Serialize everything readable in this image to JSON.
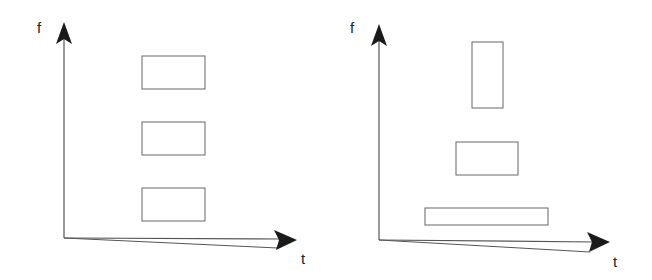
{
  "diagrams": [
    {
      "name": "stft-tiling",
      "y_axis_label": "f",
      "x_axis_label": "t",
      "tiles": [
        {
          "x": 142,
          "y": 56,
          "w": 63,
          "h": 33
        },
        {
          "x": 142,
          "y": 122,
          "w": 63,
          "h": 33
        },
        {
          "x": 142,
          "y": 188,
          "w": 63,
          "h": 33
        }
      ]
    },
    {
      "name": "wavelet-tiling",
      "y_axis_label": "f",
      "x_axis_label": "t",
      "tiles": [
        {
          "x": 472,
          "y": 42,
          "w": 31,
          "h": 66
        },
        {
          "x": 456,
          "y": 142,
          "w": 62,
          "h": 33
        },
        {
          "x": 425,
          "y": 208,
          "w": 123,
          "h": 17
        }
      ]
    }
  ],
  "colors": {
    "stroke": "#555555",
    "arrow": "#1a1a1a",
    "text": "#222222"
  }
}
